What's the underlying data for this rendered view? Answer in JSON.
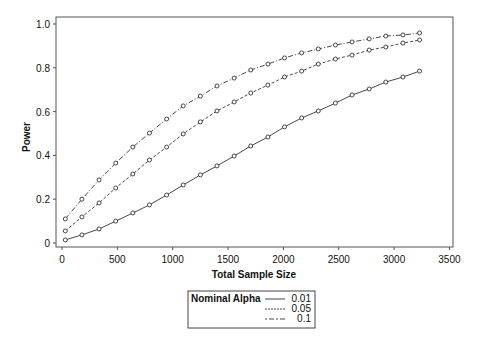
{
  "chart_data": {
    "type": "line",
    "title": "",
    "xlabel": "Total Sample Size",
    "ylabel": "Power",
    "xlim": [
      0,
      3500
    ],
    "ylim": [
      0,
      1.0
    ],
    "x_ticks": [
      0,
      500,
      1000,
      1500,
      2000,
      2500,
      3000,
      3500
    ],
    "x_tick_labels": [
      "0",
      "500",
      "1000",
      "1500",
      "2000",
      "2500",
      "3000",
      "3500"
    ],
    "y_ticks": [
      0,
      0.2,
      0.4,
      0.6,
      0.8,
      1.0
    ],
    "y_tick_labels": [
      "0",
      "0.2",
      "0.4",
      "0.6",
      "0.8",
      "1.0"
    ],
    "grid": false,
    "legend_position": "bottom",
    "legend_title": "Nominal Alpha",
    "markers": "open-circle",
    "x": [
      30,
      180,
      335,
      485,
      640,
      790,
      945,
      1095,
      1250,
      1400,
      1555,
      1705,
      1860,
      2010,
      2165,
      2315,
      2470,
      2620,
      2775,
      2925,
      3080,
      3230
    ],
    "series": [
      {
        "name": "0.01",
        "line_style": "solid",
        "values": [
          0.014,
          0.037,
          0.064,
          0.1,
          0.137,
          0.174,
          0.219,
          0.265,
          0.311,
          0.352,
          0.397,
          0.443,
          0.484,
          0.53,
          0.571,
          0.603,
          0.639,
          0.676,
          0.703,
          0.735,
          0.758,
          0.785
        ]
      },
      {
        "name": "0.05",
        "line_style": "dashed",
        "values": [
          0.055,
          0.119,
          0.183,
          0.251,
          0.315,
          0.379,
          0.438,
          0.498,
          0.553,
          0.603,
          0.644,
          0.685,
          0.721,
          0.758,
          0.785,
          0.817,
          0.84,
          0.858,
          0.881,
          0.895,
          0.913,
          0.927
        ]
      },
      {
        "name": "0.1",
        "line_style": "dash-dot",
        "values": [
          0.11,
          0.2,
          0.288,
          0.365,
          0.438,
          0.502,
          0.566,
          0.626,
          0.671,
          0.717,
          0.753,
          0.79,
          0.817,
          0.845,
          0.868,
          0.886,
          0.904,
          0.918,
          0.932,
          0.945,
          0.95,
          0.959
        ]
      }
    ]
  },
  "legend": {
    "title": "Nominal Alpha",
    "items": [
      {
        "label": "0.01",
        "style": "solid"
      },
      {
        "label": "0.05",
        "style": "dashed"
      },
      {
        "label": "0.1",
        "style": "dash-dot"
      }
    ]
  },
  "colors": {
    "line": "#333333",
    "frame": "#555555",
    "background": "#ffffff"
  }
}
